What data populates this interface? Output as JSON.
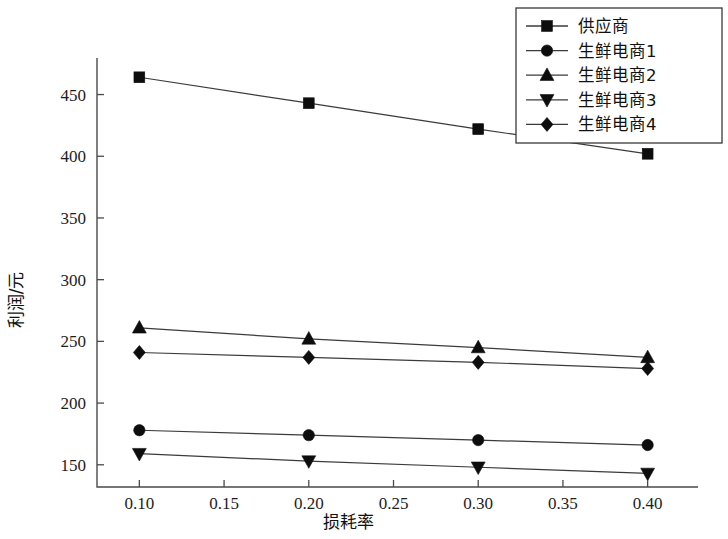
{
  "chart_data": {
    "type": "line",
    "title": "",
    "xlabel": "损耗率",
    "ylabel": "利润/元",
    "x": [
      0.1,
      0.2,
      0.3,
      0.4
    ],
    "xlim": [
      0.075,
      0.425
    ],
    "ylim": [
      132,
      478
    ],
    "xticks": [
      0.1,
      0.15,
      0.2,
      0.25,
      0.3,
      0.35,
      0.4
    ],
    "xtick_labels": [
      "0.10",
      "0.15",
      "0.20",
      "0.25",
      "0.30",
      "0.35",
      "0.40"
    ],
    "yticks": [
      150,
      200,
      250,
      300,
      350,
      400,
      450
    ],
    "ytick_labels": [
      "150",
      "200",
      "250",
      "300",
      "350",
      "400",
      "450"
    ],
    "grid": false,
    "legend_position": "top-right",
    "series": [
      {
        "name": "供应商",
        "marker": "square",
        "values": [
          464,
          443,
          422,
          402
        ]
      },
      {
        "name": "生鲜电商1",
        "marker": "circle",
        "values": [
          178,
          174,
          170,
          166
        ]
      },
      {
        "name": "生鲜电商2",
        "marker": "triangle-up",
        "values": [
          261,
          252,
          245,
          237
        ]
      },
      {
        "name": "生鲜电商3",
        "marker": "triangle-down",
        "values": [
          159,
          153,
          148,
          143
        ]
      },
      {
        "name": "生鲜电商4",
        "marker": "diamond",
        "values": [
          241,
          237,
          233,
          228
        ]
      }
    ]
  },
  "legend": {
    "items": [
      {
        "label": "供应商",
        "marker": "square"
      },
      {
        "label": "生鲜电商1",
        "marker": "circle"
      },
      {
        "label": "生鲜电商2",
        "marker": "triangle-up"
      },
      {
        "label": "生鲜电商3",
        "marker": "triangle-down"
      },
      {
        "label": "生鲜电商4",
        "marker": "diamond"
      }
    ]
  },
  "colors": {
    "line": "#3b3b3b",
    "marker": "#0d0d0d",
    "axis": "#4a4a4a",
    "text": "#1a1a1a",
    "background": "#ffffff"
  }
}
